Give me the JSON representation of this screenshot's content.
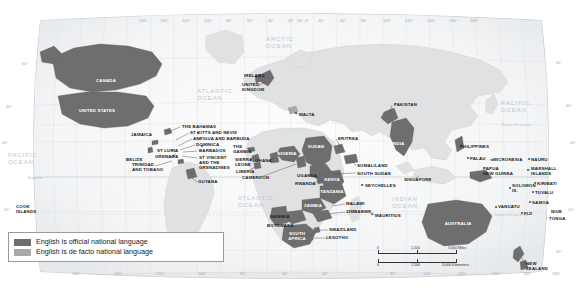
{
  "map": {
    "title": "World map of English-speaking countries",
    "legend": {
      "items": [
        {
          "label": "English is official national language",
          "color": "#6e6e6e"
        },
        {
          "label": "English is de facto national language",
          "color": "#a9a9a9"
        }
      ]
    },
    "scale_bar": {
      "miles": {
        "zero": "0",
        "mid": "1,500",
        "end": "3,000 Miles"
      },
      "kilometers": {
        "zero": "0",
        "mid": "1,500",
        "end": "3,000 Kilometers"
      }
    },
    "oceans": [
      {
        "name": "ARCTIC\nOCEAN",
        "x": 266,
        "y": 36
      },
      {
        "name": "ATLANTIC\nOCEAN",
        "x": 197,
        "y": 88
      },
      {
        "name": "ATLANTIC\nOCEAN",
        "x": 238,
        "y": 195
      },
      {
        "name": "PACIFIC\nOCEAN",
        "x": 501,
        "y": 100
      },
      {
        "name": "PACIFIC\nOCEAN",
        "x": 8,
        "y": 152
      },
      {
        "name": "INDIAN\nOCEAN",
        "x": 392,
        "y": 196
      }
    ],
    "geolines": [
      {
        "label": "Tropic of Cancer",
        "x": 501,
        "y": 122
      },
      {
        "label": "Equator",
        "x": 28,
        "y": 175
      },
      {
        "label": "Tropic of Capricorn",
        "x": 494,
        "y": 212
      }
    ],
    "lat_ticks": [
      {
        "label": "60°",
        "x": 22,
        "y": 61
      },
      {
        "label": "40°",
        "x": 6,
        "y": 104
      },
      {
        "label": "20°",
        "x": 2,
        "y": 140
      },
      {
        "label": "20°",
        "x": 4,
        "y": 207
      },
      {
        "label": "60°",
        "x": 556,
        "y": 60
      },
      {
        "label": "40°",
        "x": 566,
        "y": 103
      },
      {
        "label": "20°",
        "x": 570,
        "y": 140
      },
      {
        "label": "20°",
        "x": 568,
        "y": 207
      },
      {
        "label": "40°",
        "x": 556,
        "y": 249
      }
    ],
    "lon_ticks_top": [
      {
        "label": "160°",
        "x": 139
      },
      {
        "label": "140°",
        "x": 160
      },
      {
        "label": "120°",
        "x": 182
      },
      {
        "label": "100°",
        "x": 204
      },
      {
        "label": "80°",
        "x": 226
      },
      {
        "label": "60°",
        "x": 247
      },
      {
        "label": "40°",
        "x": 268
      },
      {
        "label": "20°",
        "x": 288
      },
      {
        "label": "0°",
        "x": 305
      },
      {
        "label": "20°",
        "x": 297
      },
      {
        "label": "40°",
        "x": 318
      },
      {
        "label": "60°",
        "x": 340
      },
      {
        "label": "80°",
        "x": 361
      },
      {
        "label": "100°",
        "x": 383
      },
      {
        "label": "120°",
        "x": 405
      },
      {
        "label": "140°",
        "x": 427
      },
      {
        "label": "160°",
        "x": 449
      },
      {
        "label": "180°",
        "x": 470
      }
    ],
    "lon_ticks_bottom": [
      {
        "label": "160°",
        "x": 72
      },
      {
        "label": "140°",
        "x": 114
      },
      {
        "label": "120°",
        "x": 156
      },
      {
        "label": "100°",
        "x": 198
      },
      {
        "label": "80°",
        "x": 240
      },
      {
        "label": "60°",
        "x": 282
      },
      {
        "label": "40°",
        "x": 322
      },
      {
        "label": "80°",
        "x": 390
      },
      {
        "label": "100°",
        "x": 423
      },
      {
        "label": "120°",
        "x": 458
      },
      {
        "label": "140°",
        "x": 492
      },
      {
        "label": "160°",
        "x": 523
      },
      {
        "label": "180°",
        "x": 552
      }
    ],
    "country_labels": [
      {
        "name": "CANADA",
        "x": 106,
        "y": 79,
        "align": "ctr",
        "light": true
      },
      {
        "name": "UNITED STATES",
        "x": 97,
        "y": 109,
        "align": "ctr",
        "light": true
      },
      {
        "name": "JAMAICA",
        "x": 131,
        "y": 133,
        "align": "lft"
      },
      {
        "name": "BELIZE",
        "x": 126,
        "y": 158,
        "align": "lft"
      },
      {
        "name": "THE BAHAMAS",
        "x": 182,
        "y": 125,
        "align": "lft"
      },
      {
        "name": "ST KITTS AND NEVIS",
        "x": 190,
        "y": 131,
        "align": "lft"
      },
      {
        "name": "ANTIGUA AND BARBUDA",
        "x": 193,
        "y": 137,
        "align": "lft"
      },
      {
        "name": "DOMINICA",
        "x": 196,
        "y": 143,
        "align": "lft"
      },
      {
        "name": "BARBADOS",
        "x": 199,
        "y": 149,
        "align": "lft"
      },
      {
        "name": "ST VINCENT\nAND THE\nGRENADINES",
        "x": 199,
        "y": 156,
        "align": "lft"
      },
      {
        "name": "ST LUCIA",
        "x": 157,
        "y": 149,
        "align": "lft"
      },
      {
        "name": "GRENADA",
        "x": 155,
        "y": 155,
        "align": "lft"
      },
      {
        "name": "TRINIDAD\nAND TOBAGO",
        "x": 132,
        "y": 163,
        "align": "lft"
      },
      {
        "name": "GUYANA",
        "x": 198,
        "y": 180,
        "align": "lft"
      },
      {
        "name": "IRELAND",
        "x": 244,
        "y": 74,
        "align": "lft"
      },
      {
        "name": "UNITED\nKINGDOM",
        "x": 242,
        "y": 83,
        "align": "lft"
      },
      {
        "name": "MALTA",
        "x": 299,
        "y": 113,
        "align": "lft"
      },
      {
        "name": "THE\nGAMBIA",
        "x": 233,
        "y": 145,
        "align": "lft"
      },
      {
        "name": "SIERRA\nLEONE",
        "x": 235,
        "y": 158,
        "align": "lft"
      },
      {
        "name": "LIBERIA",
        "x": 236,
        "y": 170,
        "align": "lft"
      },
      {
        "name": "GHANA",
        "x": 255,
        "y": 159,
        "align": "lft"
      },
      {
        "name": "CAMEROON",
        "x": 242,
        "y": 176,
        "align": "lft"
      },
      {
        "name": "NIGERIA",
        "x": 287,
        "y": 152,
        "align": "ctr",
        "light": true
      },
      {
        "name": "SUDAN",
        "x": 316,
        "y": 145,
        "align": "ctr",
        "light": true
      },
      {
        "name": "ERITREA",
        "x": 338,
        "y": 137,
        "align": "lft"
      },
      {
        "name": "SOMALILAND",
        "x": 357,
        "y": 164,
        "align": "lft"
      },
      {
        "name": "SOUTH SUDAN",
        "x": 357,
        "y": 172,
        "align": "lft"
      },
      {
        "name": "UGANDA",
        "x": 297,
        "y": 174,
        "align": "lft"
      },
      {
        "name": "RWANDA",
        "x": 295,
        "y": 182,
        "align": "lft"
      },
      {
        "name": "KENYA",
        "x": 332,
        "y": 178,
        "align": "ctr",
        "light": true
      },
      {
        "name": "TANZANIA",
        "x": 332,
        "y": 190,
        "align": "ctr",
        "light": true
      },
      {
        "name": "SEYCHELLES",
        "x": 365,
        "y": 184,
        "align": "lft"
      },
      {
        "name": "ZAMBIA",
        "x": 313,
        "y": 204,
        "align": "ctr",
        "light": true
      },
      {
        "name": "MALAWI",
        "x": 346,
        "y": 202,
        "align": "lft"
      },
      {
        "name": "ZIMBABWE",
        "x": 346,
        "y": 210,
        "align": "lft"
      },
      {
        "name": "NAMIBIA",
        "x": 270,
        "y": 215,
        "align": "lft"
      },
      {
        "name": "BOTSWANA",
        "x": 267,
        "y": 224,
        "align": "lft"
      },
      {
        "name": "MAURITIUS",
        "x": 375,
        "y": 214,
        "align": "lft"
      },
      {
        "name": "SWAZILAND",
        "x": 329,
        "y": 228,
        "align": "lft"
      },
      {
        "name": "LESOTHO",
        "x": 326,
        "y": 236,
        "align": "lft"
      },
      {
        "name": "SOUTH\nAFRICA",
        "x": 297,
        "y": 232,
        "align": "ctr",
        "light": true
      },
      {
        "name": "PAKISTAN",
        "x": 394,
        "y": 103,
        "align": "lft"
      },
      {
        "name": "INDIA",
        "x": 398,
        "y": 142,
        "align": "ctr",
        "light": true
      },
      {
        "name": "PHILIPPINES",
        "x": 460,
        "y": 145,
        "align": "lft"
      },
      {
        "name": "PALAU",
        "x": 470,
        "y": 157,
        "align": "lft"
      },
      {
        "name": "SINGAPORE",
        "x": 404,
        "y": 178,
        "align": "lft"
      },
      {
        "name": "PAPUA\nNEW GUINEA",
        "x": 483,
        "y": 167,
        "align": "lft"
      },
      {
        "name": "MICRONESIA",
        "x": 493,
        "y": 158,
        "align": "lft"
      },
      {
        "name": "NAURU",
        "x": 531,
        "y": 158,
        "align": "lft"
      },
      {
        "name": "MARSHALL\nISLANDS",
        "x": 531,
        "y": 167,
        "align": "lft"
      },
      {
        "name": "KIRIBATI",
        "x": 537,
        "y": 182,
        "align": "lft"
      },
      {
        "name": "SOLOMON\nIS.",
        "x": 512,
        "y": 184,
        "align": "lft"
      },
      {
        "name": "TUVALU",
        "x": 535,
        "y": 191,
        "align": "lft"
      },
      {
        "name": "SAMOA",
        "x": 532,
        "y": 201,
        "align": "lft"
      },
      {
        "name": "VANUATU",
        "x": 498,
        "y": 205,
        "align": "lft"
      },
      {
        "name": "FIJI",
        "x": 524,
        "y": 212,
        "align": "lft"
      },
      {
        "name": "NIUE",
        "x": 551,
        "y": 210,
        "align": "lft"
      },
      {
        "name": "TONGA",
        "x": 549,
        "y": 217,
        "align": "lft"
      },
      {
        "name": "COOK\nISLANDS",
        "x": 16,
        "y": 205,
        "align": "lft"
      },
      {
        "name": "AUSTRALIA",
        "x": 458,
        "y": 222,
        "align": "ctr",
        "light": true
      },
      {
        "name": "NEW\nZEALAND",
        "x": 526,
        "y": 262,
        "align": "lft"
      }
    ]
  }
}
